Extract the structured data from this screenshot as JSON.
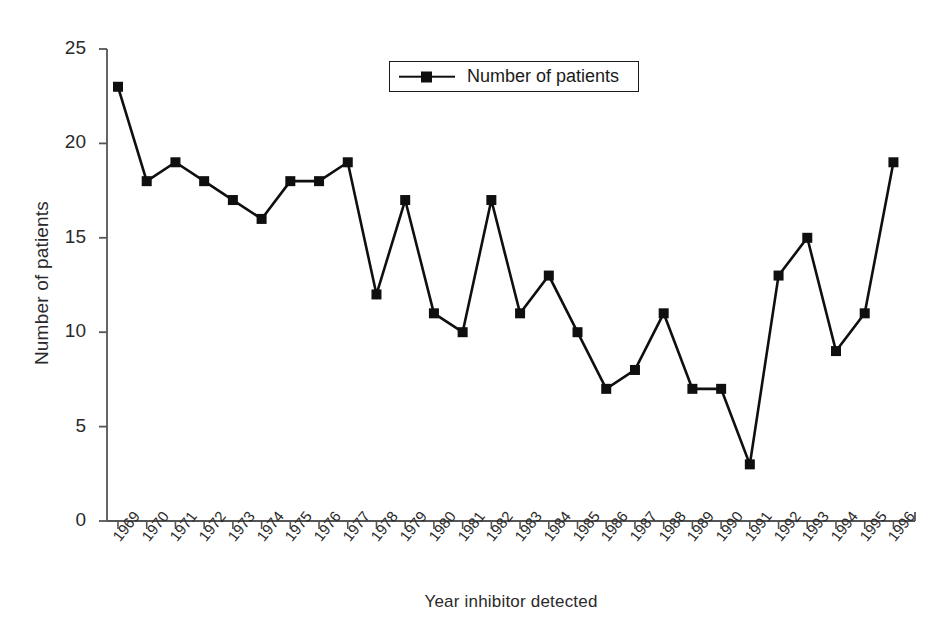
{
  "chart_data": {
    "type": "line",
    "title": "",
    "xlabel": "Year inhibitor detected",
    "ylabel": "Number of patients",
    "categories": [
      "1969",
      "1970",
      "1971",
      "1972",
      "1973",
      "1974",
      "1975",
      "1976",
      "1977",
      "1978",
      "1979",
      "1980",
      "1981",
      "1982",
      "1983",
      "1984",
      "1985",
      "1986",
      "1987",
      "1988",
      "1989",
      "1990",
      "1991",
      "1992",
      "1993",
      "1994",
      "1995",
      "1996"
    ],
    "values": [
      23,
      18,
      19,
      18,
      17,
      16,
      18,
      18,
      19,
      12,
      17,
      11,
      10,
      17,
      11,
      13,
      10,
      7,
      8,
      11,
      7,
      7,
      3,
      13,
      15,
      9,
      11,
      19
    ],
    "series": [
      {
        "name": "Number of patients",
        "values": [
          23,
          18,
          19,
          18,
          17,
          16,
          18,
          18,
          19,
          12,
          17,
          11,
          10,
          17,
          11,
          13,
          10,
          7,
          8,
          11,
          7,
          7,
          3,
          13,
          15,
          9,
          11,
          19
        ]
      }
    ],
    "ylim": [
      0,
      25
    ],
    "yticks": [
      0,
      5,
      10,
      15,
      20,
      25
    ],
    "ytick_labels": [
      "0",
      "5",
      "10",
      "15",
      "20",
      "25"
    ],
    "grid": false,
    "legend_position": "top-center",
    "marker": "square",
    "line_color": "#0f0f0f",
    "marker_color": "#0f0f0f"
  },
  "legend": {
    "entries": [
      {
        "label": "Number of patients",
        "color": "#0f0f0f",
        "marker_icon": "square-marker-icon"
      }
    ]
  },
  "axes": {
    "y_title": "Number of patients",
    "x_title": "Year inhibitor detected",
    "axis_color": "#555555"
  }
}
